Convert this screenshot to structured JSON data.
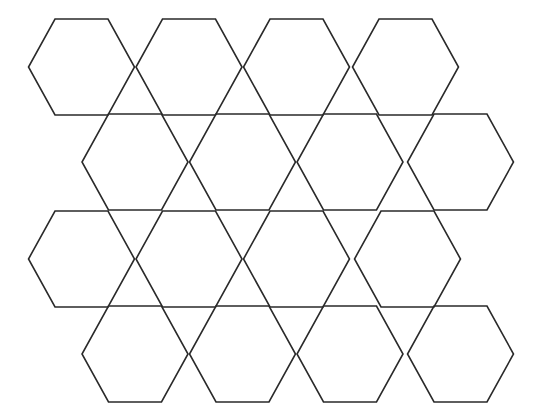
{
  "diagram": {
    "type": "hexagon-tiling",
    "background": "#ffffff",
    "stroke_color": "#2a2a2a",
    "stroke_width": 1.6,
    "hexagon": {
      "half_width": 53,
      "half_top_edge": 26.5,
      "half_height": 48
    },
    "rows": [
      {
        "cy": 67,
        "centers_x": [
          81.5,
          189,
          296.5,
          405.5
        ]
      },
      {
        "cy": 162,
        "centers_x": [
          135,
          242.5,
          350,
          460.5
        ]
      },
      {
        "cy": 259,
        "centers_x": [
          81.5,
          189,
          296.5,
          407.5
        ]
      },
      {
        "cy": 354,
        "centers_x": [
          135,
          242.5,
          350,
          460.5
        ]
      }
    ]
  }
}
